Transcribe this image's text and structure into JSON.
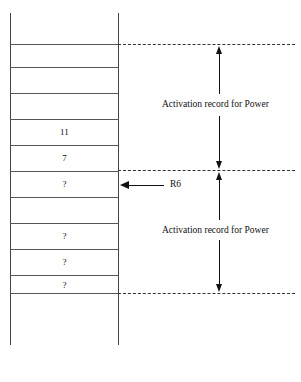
{
  "diagram": {
    "stack": {
      "cells": [
        {
          "id": "cell-1",
          "value": "",
          "top": 44,
          "height": 23
        },
        {
          "id": "cell-2",
          "value": "",
          "top": 67,
          "height": 26
        },
        {
          "id": "cell-3",
          "value": "",
          "top": 93,
          "height": 26
        },
        {
          "id": "cell-4",
          "value": "11",
          "top": 119,
          "height": 26
        },
        {
          "id": "cell-5",
          "value": "7",
          "top": 145,
          "height": 26
        },
        {
          "id": "cell-6",
          "value": "?",
          "top": 171,
          "height": 26
        },
        {
          "id": "cell-7",
          "value": "",
          "top": 197,
          "height": 26
        },
        {
          "id": "cell-8",
          "value": "?",
          "top": 223,
          "height": 26
        },
        {
          "id": "cell-9",
          "value": "?",
          "top": 249,
          "height": 26
        },
        {
          "id": "cell-10",
          "value": "?",
          "top": 275,
          "height": 18
        }
      ]
    },
    "guides": [
      {
        "id": "guide-top",
        "y": 44
      },
      {
        "id": "guide-middle",
        "y": 170
      },
      {
        "id": "guide-bottom",
        "y": 293
      }
    ],
    "spans": [
      {
        "id": "span-upper",
        "label": "Activation record for Power",
        "from_y": 44,
        "to_y": 170,
        "label_y": 100
      },
      {
        "id": "span-lower",
        "label": "Activation record for Power",
        "from_y": 170,
        "to_y": 293,
        "label_y": 226
      }
    ],
    "pointer": {
      "id": "pointer-r6",
      "label": "R6",
      "y": 185,
      "target_cell": "cell-6"
    },
    "colors": {
      "stroke": "#333333",
      "rail": "#444444",
      "rowline": "#555555",
      "text": "#111111",
      "background": "#ffffff"
    }
  }
}
